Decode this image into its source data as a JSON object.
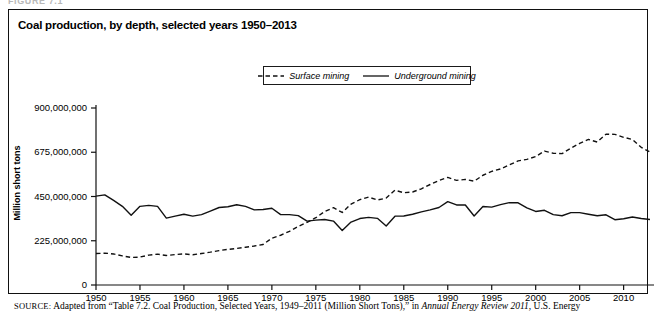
{
  "running_head": "FIGURE 7.1",
  "figure": {
    "title": "Coal production, by depth, selected years 1950–2013"
  },
  "legend": {
    "items": [
      {
        "label": "Surface mining",
        "style": "dashed",
        "color": "#111111"
      },
      {
        "label": "Underground mining",
        "style": "solid",
        "color": "#111111"
      }
    ]
  },
  "axes": {
    "y_title": "Million short tons",
    "y_ticks": [
      "0",
      "225,000,000",
      "450,000,000",
      "675,000,000",
      "900,000,000"
    ],
    "x_ticks": [
      "1950",
      "1955",
      "1960",
      "1965",
      "1970",
      "1975",
      "1980",
      "1985",
      "1990",
      "1995",
      "2000",
      "2005",
      "2010"
    ]
  },
  "source": {
    "kicker": "SOURCE:",
    "text_before": " Adapted from “Table 7.2. Coal Production, Selected Years, 1949–2011 (Million Short Tons),” in ",
    "italic": "Annual Energy Review 2011",
    "text_after": ", U.S. Energy"
  },
  "chart_data": {
    "type": "line",
    "title": "Coal production, by depth, selected years 1950–2013",
    "xlabel": "",
    "ylabel": "Million short tons",
    "xlim": [
      1950,
      2013
    ],
    "ylim": [
      0,
      900000000
    ],
    "yticks": [
      0,
      225000000,
      450000000,
      675000000,
      900000000
    ],
    "ytick_labels": [
      "0",
      "225,000,000",
      "450,000,000",
      "675,000,000",
      "900,000,000"
    ],
    "xticks": [
      1950,
      1955,
      1960,
      1965,
      1970,
      1975,
      1980,
      1985,
      1990,
      1995,
      2000,
      2005,
      2010
    ],
    "grid": false,
    "legend_position": "top-center",
    "x": [
      1950,
      1951,
      1952,
      1953,
      1954,
      1955,
      1956,
      1957,
      1958,
      1959,
      1960,
      1961,
      1962,
      1963,
      1964,
      1965,
      1966,
      1967,
      1968,
      1969,
      1970,
      1971,
      1972,
      1973,
      1974,
      1975,
      1976,
      1977,
      1978,
      1979,
      1980,
      1981,
      1982,
      1983,
      1984,
      1985,
      1986,
      1987,
      1988,
      1989,
      1990,
      1991,
      1992,
      1993,
      1994,
      1995,
      1996,
      1997,
      1998,
      1999,
      2000,
      2001,
      2002,
      2003,
      2004,
      2005,
      2006,
      2007,
      2008,
      2009,
      2010,
      2011,
      2012,
      2013
    ],
    "series": [
      {
        "name": "Surface mining",
        "style": "dashed",
        "color": "#111111",
        "values": [
          160000000,
          162000000,
          158000000,
          148000000,
          140000000,
          142000000,
          152000000,
          157000000,
          150000000,
          155000000,
          158000000,
          154000000,
          160000000,
          167000000,
          175000000,
          181000000,
          186000000,
          192000000,
          198000000,
          206000000,
          238000000,
          253000000,
          273000000,
          298000000,
          318000000,
          342000000,
          374000000,
          393000000,
          369000000,
          411000000,
          434000000,
          447000000,
          432000000,
          442000000,
          482000000,
          469000000,
          473000000,
          489000000,
          511000000,
          531000000,
          547000000,
          532000000,
          537000000,
          528000000,
          558000000,
          578000000,
          590000000,
          611000000,
          631000000,
          639000000,
          653000000,
          681000000,
          670000000,
          668000000,
          696000000,
          720000000,
          740000000,
          727000000,
          767000000,
          766000000,
          751000000,
          740000000,
          700000000,
          676000000
        ]
      },
      {
        "name": "Underground mining",
        "style": "solid",
        "color": "#111111",
        "values": [
          452000000,
          458000000,
          430000000,
          400000000,
          355000000,
          400000000,
          405000000,
          400000000,
          340000000,
          350000000,
          360000000,
          350000000,
          358000000,
          376000000,
          394000000,
          398000000,
          408000000,
          400000000,
          382000000,
          384000000,
          390000000,
          358000000,
          358000000,
          353000000,
          325000000,
          330000000,
          333000000,
          325000000,
          277000000,
          320000000,
          338000000,
          344000000,
          339000000,
          300000000,
          350000000,
          351000000,
          360000000,
          372000000,
          382000000,
          394000000,
          424000000,
          407000000,
          407000000,
          351000000,
          399000000,
          396000000,
          409000000,
          419000000,
          418000000,
          392000000,
          374000000,
          380000000,
          358000000,
          352000000,
          368000000,
          368000000,
          360000000,
          352000000,
          357000000,
          332000000,
          337000000,
          346000000,
          338000000,
          333000000
        ]
      }
    ]
  }
}
